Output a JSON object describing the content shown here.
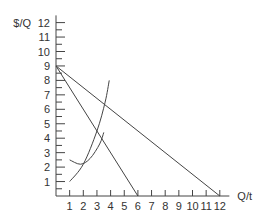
{
  "chart_data": {
    "type": "line",
    "title": "",
    "xlabel": "Q/t",
    "ylabel": "$/Q",
    "xlim": [
      0,
      12
    ],
    "ylim": [
      0,
      12
    ],
    "x_ticks": [
      1,
      2,
      3,
      4,
      5,
      6,
      7,
      8,
      9,
      10,
      11,
      12
    ],
    "y_ticks": [
      1,
      2,
      3,
      4,
      5,
      6,
      7,
      8,
      9,
      10,
      11,
      12
    ],
    "grid": false,
    "series": [
      {
        "name": "demand",
        "type": "line",
        "points": [
          [
            0,
            9
          ],
          [
            12,
            0
          ]
        ]
      },
      {
        "name": "marginal-revenue",
        "type": "line",
        "points": [
          [
            0,
            9
          ],
          [
            6,
            0
          ]
        ]
      },
      {
        "name": "marginal-cost",
        "type": "curve",
        "points": [
          [
            1,
            1
          ],
          [
            2,
            2.2
          ],
          [
            3,
            4.5
          ],
          [
            3.6,
            6.5
          ],
          [
            3.9,
            8
          ]
        ]
      },
      {
        "name": "average-cost",
        "type": "curve",
        "points": [
          [
            1,
            2.5
          ],
          [
            1.8,
            2.2
          ],
          [
            2.5,
            2.6
          ],
          [
            3.2,
            3.6
          ],
          [
            3.5,
            4.4
          ]
        ]
      }
    ]
  }
}
